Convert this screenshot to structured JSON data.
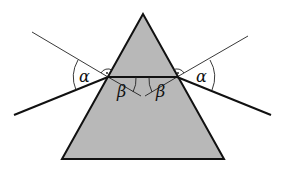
{
  "diagram": {
    "labels": {
      "incidence_left": "α",
      "refraction_left": "β",
      "refraction_right": "β",
      "emergence_right": "α"
    },
    "colors": {
      "prism_fill": "#b8b8b8",
      "line": "#111111",
      "background": "#ffffff"
    },
    "geometry": {
      "apex": [
        143,
        14
      ],
      "base_left": [
        62,
        159
      ],
      "base_right": [
        224,
        159
      ],
      "entry_point": [
        108,
        77
      ],
      "exit_point": [
        177,
        77
      ]
    }
  }
}
